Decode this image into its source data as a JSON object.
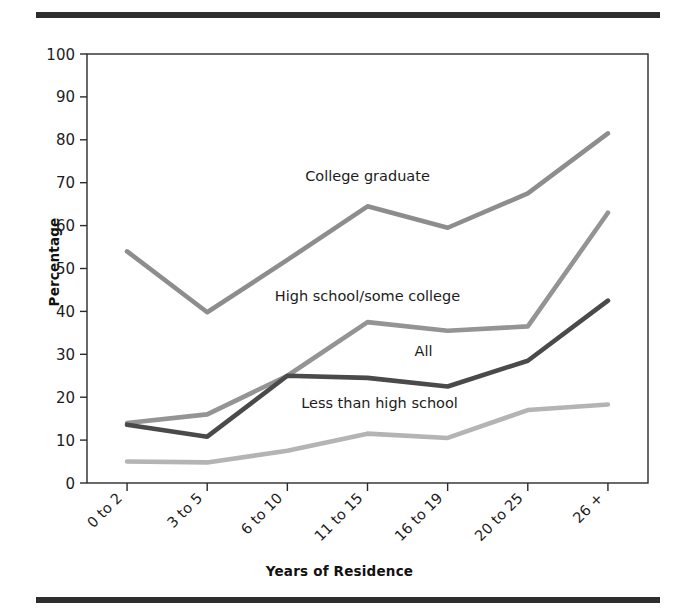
{
  "figure": {
    "top_rule": "horizontal-rule",
    "bottom_rule": "horizontal-rule"
  },
  "chart_data": {
    "type": "line",
    "title": "",
    "xlabel": "Years of Residence",
    "ylabel": "Percentage",
    "categories": [
      "0 to 2",
      "3 to 5",
      "6 to 10",
      "11 to 15",
      "16 to 19",
      "20 to 25",
      "26 +"
    ],
    "ylim": [
      0,
      100
    ],
    "yticks": [
      0,
      10,
      20,
      30,
      40,
      50,
      60,
      70,
      80,
      90,
      100
    ],
    "grid": false,
    "legend_position": "inline-labels",
    "series": [
      {
        "name": "College graduate",
        "color": "#8d8d8d",
        "values": [
          54,
          39.8,
          52,
          64.5,
          59.5,
          67.5,
          81.5
        ]
      },
      {
        "name": "High school/some college",
        "color": "#949494",
        "values": [
          14,
          16,
          25,
          37.5,
          35.5,
          36.5,
          63
        ]
      },
      {
        "name": "All",
        "color": "#4a4a4a",
        "values": [
          13.6,
          10.8,
          25,
          24.5,
          22.5,
          28.5,
          42.5
        ]
      },
      {
        "name": "Less than high school",
        "color": "#b4b4b4",
        "values": [
          5,
          4.8,
          7.5,
          11.5,
          10.5,
          17,
          18.3
        ]
      }
    ],
    "annotations": [
      {
        "text": "College graduate",
        "x": 3,
        "y": 70.5,
        "name": "series-label-college-graduate"
      },
      {
        "text": "High school/some college",
        "x": 3,
        "y": 42.5,
        "name": "series-label-high-school"
      },
      {
        "text": "All",
        "x": 3.7,
        "y": 29.5,
        "name": "series-label-all"
      },
      {
        "text": "Less than high school",
        "x": 3.15,
        "y": 17.5,
        "name": "series-label-less-than-high-school"
      }
    ]
  }
}
